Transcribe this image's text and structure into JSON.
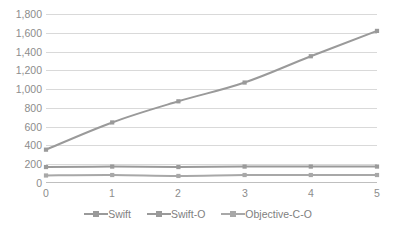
{
  "chart_data": {
    "type": "line",
    "title": "",
    "subtitle": "",
    "xlabel": "",
    "ylabel": "",
    "x": [
      0,
      1,
      2,
      3,
      4,
      5
    ],
    "categories": [
      "0",
      "1",
      "2",
      "3",
      "4",
      "5"
    ],
    "xtick_labels": [
      "0",
      "1",
      "2",
      "3",
      "4",
      "5"
    ],
    "ytick_labels": [
      "0",
      "200",
      "400",
      "600",
      "800",
      "1,000",
      "1,200",
      "1,400",
      "1,600",
      "1,800"
    ],
    "ytick_values": [
      0,
      200,
      400,
      600,
      800,
      1000,
      1200,
      1400,
      1600,
      1800
    ],
    "ylim": [
      0,
      1800
    ],
    "xlim": [
      0,
      5
    ],
    "grid": "horizontal",
    "legend_position": "bottom-center",
    "marker": "square",
    "series": [
      {
        "name": "Swift",
        "color": "#9a9a9a",
        "values": [
          355,
          645,
          870,
          1070,
          1350,
          1620
        ]
      },
      {
        "name": "Swift-O",
        "color": "#9a9a9a",
        "values": [
          170,
          175,
          170,
          175,
          175,
          175
        ]
      },
      {
        "name": "Objective-C-O",
        "color": "#a8a8a8",
        "values": [
          80,
          85,
          75,
          85,
          85,
          85
        ]
      }
    ],
    "legend": [
      "Swift",
      "Swift-O",
      "Objective-C-O"
    ]
  },
  "colors": {
    "gridline": "#d9d9d9",
    "axis": "#bfbfbf",
    "tick_text": "#8c8c8c",
    "legend_text": "#808080",
    "series_swift": "#9a9a9a",
    "series_swift_o": "#9a9a9a",
    "series_objective_c_o": "#a8a8a8",
    "background": "#ffffff"
  }
}
